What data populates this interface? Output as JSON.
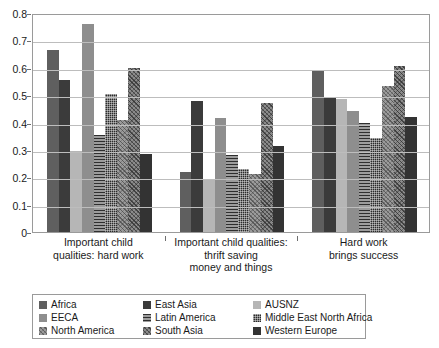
{
  "chart_data": {
    "type": "bar",
    "title": "",
    "xlabel": "",
    "ylabel": "",
    "ylim": [
      0,
      0.8
    ],
    "ytick_labels": [
      "0.8",
      "0.7",
      "0.6",
      "0.5",
      "0.4",
      "0.3",
      "0.2",
      "0.1",
      "0"
    ],
    "ytick_values": [
      0.8,
      0.7,
      0.6,
      0.5,
      0.4,
      0.3,
      0.2,
      0.1,
      0
    ],
    "grid": true,
    "legend_position": "bottom-left",
    "categories": [
      "Important child\nqualities: hard work",
      "Important child qualities:\nthrift saving\nmoney and things",
      "Hard work\nbrings success"
    ],
    "category_lines": [
      [
        "Important child",
        "qualities: hard work"
      ],
      [
        "Important child qualities:",
        "thrift saving",
        "money and things"
      ],
      [
        "Hard work",
        "brings success"
      ]
    ],
    "series": [
      {
        "name": "Africa",
        "fill": "f-africa",
        "color": "#5f5f5f",
        "values": [
          0.665,
          0.218,
          0.588
        ]
      },
      {
        "name": "East Asia",
        "fill": "f-eastasia",
        "color": "#3b3b3b",
        "values": [
          0.555,
          0.48,
          0.495
        ]
      },
      {
        "name": "AUSNZ",
        "fill": "f-ausnz",
        "color": "#b6b6b6",
        "values": [
          0.295,
          0.193,
          0.485
        ]
      },
      {
        "name": "EECA",
        "fill": "f-eeca",
        "color": "#8e8e8e",
        "values": [
          0.76,
          0.418,
          0.442
        ]
      },
      {
        "name": "Latin America",
        "fill": "f-latin",
        "color": "#6a6a6a",
        "values": [
          0.355,
          0.283,
          0.4
        ]
      },
      {
        "name": "Middle East North Africa",
        "fill": "f-mena",
        "color": "#2b2b2b",
        "values": [
          0.505,
          0.232,
          0.344
        ]
      },
      {
        "name": "North America",
        "fill": "f-northam",
        "color": "#9b9b9b",
        "values": [
          0.41,
          0.212,
          0.535
        ]
      },
      {
        "name": "South Asia",
        "fill": "f-southasia",
        "color": "#8b8b8b",
        "values": [
          0.6,
          0.473,
          0.607
        ]
      },
      {
        "name": "Western Europe",
        "fill": "f-westeurope",
        "color": "#333333",
        "values": [
          0.285,
          0.315,
          0.42
        ]
      }
    ]
  },
  "legend": {
    "order": [
      "Africa",
      "East Asia",
      "AUSNZ",
      "EECA",
      "Latin America",
      "Middle East North Africa",
      "North America",
      "South Asia",
      "Western Europe"
    ]
  }
}
